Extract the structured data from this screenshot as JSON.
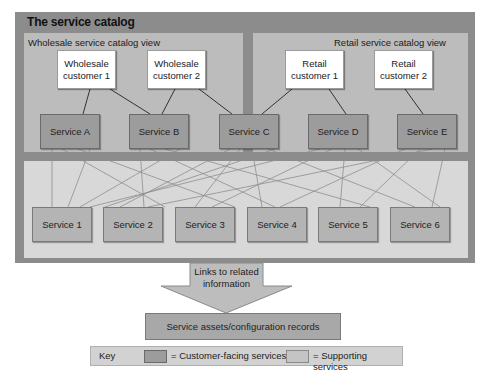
{
  "catalog": {
    "title": "The service catalog",
    "colors": {
      "frame": "#8c8c8c",
      "view": "#bcbcbc",
      "supporting_band": "#d8d8d8",
      "customer_facing": "#9c9c9c",
      "supporting": "#b4b4b4",
      "customer_box": "#ffffff"
    },
    "views": [
      {
        "label": "Wholesale service catalog view",
        "customers": [
          {
            "line1": "Wholesale",
            "line2": "customer 1"
          },
          {
            "line1": "Wholesale",
            "line2": "customer 2"
          }
        ]
      },
      {
        "label": "Retail service catalog view",
        "customers": [
          {
            "line1": "Retail",
            "line2": "customer 1"
          },
          {
            "line1": "Retail",
            "line2": "customer 2"
          }
        ]
      }
    ],
    "customer_facing_services": [
      "Service A",
      "Service B",
      "Service C",
      "Service D",
      "Service E"
    ],
    "supporting_services": [
      "Service 1",
      "Service 2",
      "Service 3",
      "Service 4",
      "Service 5",
      "Service 6"
    ],
    "customer_links": [
      [
        "Wholesale customer 1",
        "Service A"
      ],
      [
        "Wholesale customer 1",
        "Service B"
      ],
      [
        "Wholesale customer 2",
        "Service B"
      ],
      [
        "Wholesale customer 2",
        "Service C"
      ],
      [
        "Retail customer 1",
        "Service C"
      ],
      [
        "Retail customer 1",
        "Service D"
      ],
      [
        "Retail customer 2",
        "Service E"
      ]
    ]
  },
  "arrow": {
    "line1": "Links to related",
    "line2": "information"
  },
  "assets": {
    "label": "Service assets/configuration records"
  },
  "key": {
    "label": "Key",
    "customer_facing": "= Customer-facing services",
    "supporting": "= Supporting services"
  }
}
